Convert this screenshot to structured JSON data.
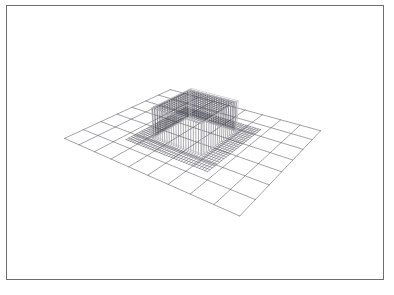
{
  "figure": {
    "title": "",
    "background_color": "#ffffff",
    "frame_border_color": "#6e6e72",
    "frame": {
      "x": 6,
      "y": 5,
      "width": 378,
      "height": 275
    }
  },
  "chart_data": {
    "type": "surface",
    "title": "",
    "xlabel": "",
    "ylabel": "",
    "zlabel": "",
    "grid": true,
    "legend": null,
    "axes": {
      "xlim": [
        -1,
        1
      ],
      "ylim": [
        -1,
        1
      ],
      "zlim": [
        0,
        1
      ]
    },
    "surface": {
      "name": "box-plateau",
      "mesh_nx": 34,
      "mesh_ny": 26,
      "line_color": "#3c3c46",
      "line_width": 0.45,
      "function": "z = 1 if (|x| <= 0.60 and |y| <= 0.62) else 0",
      "plateau_height": 1.0,
      "plateau_x_range": [
        -0.6,
        0.6
      ],
      "plateau_y_range": [
        -0.62,
        0.62
      ]
    },
    "reference_grid": {
      "name": "ground-grid",
      "line_color": "#55555f",
      "line_width": 0.6,
      "nx": 9,
      "ny": 7,
      "z": 0
    },
    "silhouette": {
      "name": "plateau-silhouette",
      "line_color": "#b9b9bf",
      "line_width": 0.8
    },
    "view": {
      "azimuth_deg": 36,
      "elevation_deg": 26,
      "projection": "perspective",
      "distance": 8.0,
      "z_scale": 0.62
    }
  },
  "elements": {
    "viewport_name": "surface-plot-viewport",
    "frame_name": "plot-frame",
    "canvas_name": "surface-plot-canvas"
  }
}
